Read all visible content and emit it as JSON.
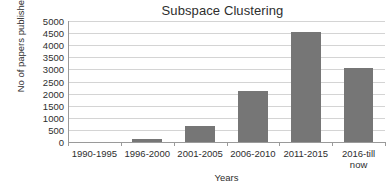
{
  "chart_data": {
    "type": "bar",
    "title": "Subspace Clustering",
    "xlabel": "Years",
    "ylabel": "No of papers published",
    "categories": [
      "1990-1995",
      "1996-2000",
      "2001-2005",
      "2006-2010",
      "2011-2015",
      "2016-till now"
    ],
    "category_lines": [
      [
        "1990-1995"
      ],
      [
        "1996-2000"
      ],
      [
        "2001-2005"
      ],
      [
        "2006-2010"
      ],
      [
        "2011-2015"
      ],
      [
        "2016-till",
        "now"
      ]
    ],
    "values": [
      0,
      120,
      680,
      2100,
      4550,
      3050
    ],
    "ylim": [
      0,
      5000
    ],
    "ytick_values": [
      0,
      500,
      1000,
      1500,
      2000,
      2500,
      3000,
      3500,
      4000,
      4500,
      5000
    ],
    "ytick_labels": [
      "0",
      "500",
      "1000",
      "1500",
      "2000",
      "2500",
      "3000",
      "3500",
      "4000",
      "4500",
      "5000"
    ],
    "grid": "horizontal",
    "legend": "none",
    "bar_color": "#767676",
    "gridline_color": "#d4d4d4",
    "axis_color": "#9a9a9a",
    "background_color": "#ffffff"
  }
}
